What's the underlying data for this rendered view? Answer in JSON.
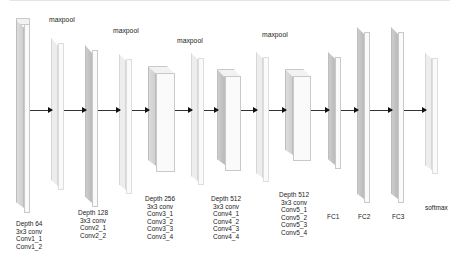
{
  "diagram": {
    "maxpool_label": "maxpool",
    "layers": [
      {
        "id": "conv1",
        "lines": [
          "Depth 64",
          "3x3 conv",
          "Conv1_1",
          "Conv1_2"
        ]
      },
      {
        "id": "conv2",
        "lines": [
          "Depth 128",
          "3x3 conv",
          "Conv2_1",
          "Conv2_2"
        ]
      },
      {
        "id": "conv3",
        "lines": [
          "Depth 256",
          "3x3 conv",
          "Conv3_1",
          "Conv3_2",
          "Conv3_3",
          "Conv3_4"
        ]
      },
      {
        "id": "conv4",
        "lines": [
          "Depth 512",
          "3x3 conv",
          "Conv4_1",
          "Conv4_2",
          "Conv4_3",
          "Conv4_4"
        ]
      },
      {
        "id": "conv5",
        "lines": [
          "Depth 512",
          "3x3 conv",
          "Conv5_1",
          "Conv5_2",
          "Conv5_3",
          "Conv5_4"
        ]
      },
      {
        "id": "fc1",
        "lines": [
          "FC1"
        ]
      },
      {
        "id": "fc2",
        "lines": [
          "FC2"
        ]
      },
      {
        "id": "fc3",
        "lines": [
          "FC3"
        ]
      },
      {
        "id": "softmax",
        "lines": [
          "softmax"
        ]
      }
    ],
    "maxpools": [
      "maxpool",
      "maxpool",
      "maxpool",
      "maxpool"
    ]
  }
}
